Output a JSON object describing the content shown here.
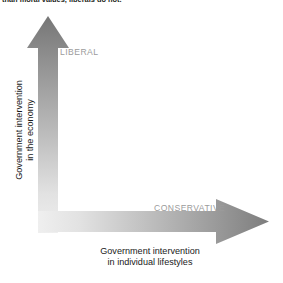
{
  "caption": {
    "text": "than moral values, liberals do not."
  },
  "diagram": {
    "type": "political-spectrum-axes",
    "y_axis": {
      "line1": "Government intervention",
      "line2": "in the economy",
      "direction": "up",
      "arrow_name": "vertical-axis-arrow"
    },
    "x_axis": {
      "line1": "Government intervention",
      "line2": "in individual lifestyles",
      "direction": "right",
      "arrow_name": "horizontal-axis-arrow"
    },
    "labels": {
      "liberal": "LIBERAL",
      "conservative": "CONSERVATIVE"
    },
    "colors": {
      "arrow_dark": "#757575",
      "arrow_mid": "#b3b3b3",
      "arrow_light": "#ededed",
      "label_gray": "#9b9b9b",
      "text_black": "#1a1a1a",
      "background": "#ffffff"
    }
  }
}
